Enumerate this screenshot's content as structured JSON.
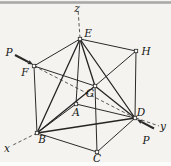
{
  "figure": {
    "width": 171,
    "height": 166,
    "background_color": "#f4f3f0",
    "top_strip_color": "#a9a9a7",
    "bottom_strip_color": "#fbfbfa",
    "edge_color": "#2a2a28",
    "diagonal_color": "#242422",
    "dash_color": "#4a4a48",
    "arrow_color": "#2a2a28",
    "label_color": "#171715",
    "marker_fill": "#f7f6f4",
    "vertices": {
      "A": {
        "x": 76,
        "y": 104
      },
      "B": {
        "x": 37,
        "y": 133
      },
      "C": {
        "x": 97,
        "y": 152
      },
      "D": {
        "x": 135,
        "y": 118
      },
      "E": {
        "x": 80,
        "y": 39
      },
      "F": {
        "x": 34,
        "y": 66
      },
      "G": {
        "x": 95,
        "y": 86
      },
      "H": {
        "x": 136,
        "y": 51
      }
    },
    "cube_edges": [
      [
        "A",
        "B"
      ],
      [
        "B",
        "C"
      ],
      [
        "C",
        "D"
      ],
      [
        "D",
        "A"
      ],
      [
        "E",
        "F"
      ],
      [
        "F",
        "G"
      ],
      [
        "G",
        "H"
      ],
      [
        "H",
        "E"
      ],
      [
        "A",
        "E"
      ],
      [
        "B",
        "F"
      ],
      [
        "C",
        "G"
      ],
      [
        "D",
        "H"
      ]
    ],
    "diagonal_edges": [
      [
        "B",
        "D"
      ],
      [
        "B",
        "E"
      ],
      [
        "B",
        "G"
      ],
      [
        "D",
        "E"
      ],
      [
        "D",
        "G"
      ],
      [
        "E",
        "G"
      ]
    ],
    "dashed_lines": [
      {
        "name": "z-axis-line",
        "x1": 80,
        "y1": 38,
        "x2": 78,
        "y2": 9
      },
      {
        "name": "x-axis-line",
        "x1": 37,
        "y1": 133,
        "x2": 11,
        "y2": 146
      },
      {
        "name": "y-axis-line",
        "x1": 136,
        "y1": 118,
        "x2": 159,
        "y2": 126
      },
      {
        "name": "force-line-FD",
        "x1": 34,
        "y1": 66,
        "x2": 135,
        "y2": 118
      }
    ],
    "arrows": [
      {
        "name": "force-P-at-F-arrow",
        "x1": 15,
        "y1": 55,
        "x2": 33,
        "y2": 64.5
      },
      {
        "name": "force-P-at-D-arrow",
        "x1": 154,
        "y1": 128.5,
        "x2": 137,
        "y2": 119.5
      }
    ],
    "labels": [
      {
        "name": "label-z",
        "text": "z",
        "x": 77,
        "y": 12
      },
      {
        "name": "label-E",
        "text": "E",
        "x": 88,
        "y": 37
      },
      {
        "name": "label-H",
        "text": "H",
        "x": 146,
        "y": 55
      },
      {
        "name": "label-P-upper",
        "text": "P",
        "x": 9,
        "y": 56
      },
      {
        "name": "label-F",
        "text": "F",
        "x": 25,
        "y": 76
      },
      {
        "name": "label-G",
        "text": "G",
        "x": 90,
        "y": 97
      },
      {
        "name": "label-A",
        "text": "A",
        "x": 76,
        "y": 116
      },
      {
        "name": "label-D",
        "text": "D",
        "x": 141,
        "y": 116
      },
      {
        "name": "label-y",
        "text": "y",
        "x": 163,
        "y": 130
      },
      {
        "name": "label-P-lower",
        "text": "P",
        "x": 146,
        "y": 144
      },
      {
        "name": "label-B",
        "text": "B",
        "x": 42,
        "y": 143
      },
      {
        "name": "label-x",
        "text": "x",
        "x": 7,
        "y": 152
      },
      {
        "name": "label-C",
        "text": "C",
        "x": 97,
        "y": 162
      }
    ]
  }
}
